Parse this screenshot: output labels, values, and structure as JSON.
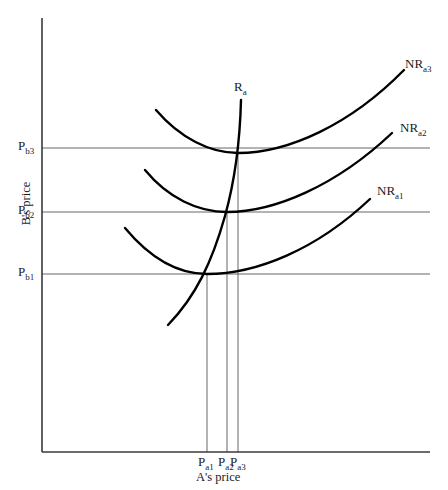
{
  "figure": {
    "axes": {
      "y_title": "B's price",
      "x_title": "A's price",
      "origin": {
        "x": 42,
        "y": 452
      },
      "y_top": 18,
      "x_right": 430
    },
    "y_ticks": [
      {
        "name": "p-b3",
        "base": "P",
        "sub": "b",
        "index": "3",
        "y": 148,
        "gridline_to_x": 430
      },
      {
        "name": "p-b2",
        "base": "P",
        "sub": "b",
        "index": "2",
        "y": 212,
        "gridline_to_x": 430
      },
      {
        "name": "p-b1",
        "base": "P",
        "sub": "b",
        "index": "1",
        "y": 274,
        "gridline_to_x": 430
      }
    ],
    "x_ticks": [
      {
        "name": "p-a1",
        "base": "P",
        "sub": "a",
        "index": "1",
        "x": 207
      },
      {
        "name": "p-a2",
        "base": "P",
        "sub": "a",
        "index": "2",
        "x": 227
      },
      {
        "name": "p-a3",
        "base": "P",
        "sub": "a",
        "index": "3",
        "x": 238
      }
    ],
    "curves": [
      {
        "name": "nr-a1",
        "base": "NR",
        "sub": "a",
        "index": "1",
        "label_x": 377,
        "label_y": 184,
        "path": "M125,228 C150,258 178,274 207,274 C256,274 316,250 370,199"
      },
      {
        "name": "nr-a2",
        "base": "NR",
        "sub": "a",
        "index": "2",
        "label_x": 400,
        "label_y": 121,
        "path": "M145,170 C168,198 198,212 227,212 C274,212 336,186 392,133"
      },
      {
        "name": "nr-a3",
        "base": "NR",
        "sub": "a",
        "index": "3",
        "label_x": 405,
        "label_y": 57,
        "path": "M156,110 C180,138 210,153 238,153 C288,153 350,125 404,70"
      },
      {
        "name": "r-a",
        "base": "R",
        "sub": "a",
        "index": "",
        "label_x": 234,
        "label_y": 80,
        "path": "M168,325 C196,296 212,262 225,216 C235,180 240,140 241,100"
      }
    ],
    "drop_lines": [
      {
        "name": "drop-line-pa1",
        "x": 207,
        "y_from": 274,
        "y_to": 452
      },
      {
        "name": "drop-line-pa2",
        "x": 227,
        "y_from": 212,
        "y_to": 452
      },
      {
        "name": "drop-line-pa3",
        "x": 238,
        "y_from": 153,
        "y_to": 452
      }
    ],
    "colors": {
      "axis": "#3a3a3a",
      "gridline": "#555555",
      "curve": "#000000",
      "text": "#1a1a1a"
    }
  },
  "chart_data": {
    "type": "line",
    "title": "",
    "xlabel": "A's price",
    "ylabel": "B's price",
    "grid": true,
    "legend_position": "inline-right",
    "series": [
      {
        "name": "NR_a1",
        "description": "B's iso-net-revenue curve for A's price level 1 (U-shaped)",
        "minimum_point": {
          "x": "P_a1",
          "y": "P_b1"
        }
      },
      {
        "name": "NR_a2",
        "description": "B's iso-net-revenue curve for A's price level 2 (U-shaped)",
        "minimum_point": {
          "x": "P_a2",
          "y": "P_b2"
        }
      },
      {
        "name": "NR_a3",
        "description": "B's iso-net-revenue curve for A's price level 3 (U-shaped)",
        "minimum_point": {
          "x": "P_a3",
          "y": "P_b3"
        }
      },
      {
        "name": "R_a",
        "description": "A's reaction curve passing through the minima of the NR curves",
        "points": [
          {
            "x": "P_a1",
            "y": "P_b1"
          },
          {
            "x": "P_a2",
            "y": "P_b2"
          },
          {
            "x": "P_a3",
            "y": "P_b3"
          }
        ]
      }
    ],
    "x_tick_labels": [
      "P_a1",
      "P_a2",
      "P_a3"
    ],
    "y_tick_labels": [
      "P_b1",
      "P_b2",
      "P_b3"
    ],
    "annotations": [
      "NR_a1",
      "NR_a2",
      "NR_a3",
      "R_a"
    ]
  }
}
